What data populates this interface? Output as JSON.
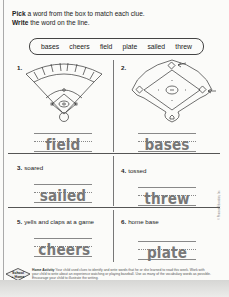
{
  "instructions": {
    "line1_bold": "Pick",
    "line1_rest": " a word from the box to match each clue.",
    "line2_bold": "Write",
    "line2_rest": " the word on the line."
  },
  "word_box": [
    "bases",
    "cheers",
    "field",
    "plate",
    "sailed",
    "threw"
  ],
  "items": [
    {
      "number": "1.",
      "clue": "",
      "answer": "field",
      "image": "baseball-field-illustration"
    },
    {
      "number": "2.",
      "clue": "",
      "answer": "bases",
      "image": "baseball-diamond-with-arrows-illustration"
    },
    {
      "number": "3.",
      "clue": "soared",
      "answer": "sailed"
    },
    {
      "number": "4.",
      "clue": "tossed",
      "answer": "threw"
    },
    {
      "number": "5.",
      "clue": "yells and claps at a game",
      "answer": "cheers"
    },
    {
      "number": "6.",
      "clue": "home base",
      "answer": "plate"
    }
  ],
  "footer": {
    "logo_line1": "School",
    "logo_line2": "+ Home",
    "activity_label": "Home Activity",
    "activity_text": " Your child used clues to identify and write words that he or she learned to read this week. Work with your child to write about an experience watching or playing baseball. Use as many of the vocabulary words as possible. Encourage your child to illustrate the writing."
  },
  "copyright": "© Pearson Education, Inc."
}
